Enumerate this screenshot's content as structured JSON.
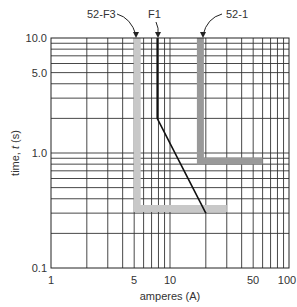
{
  "chart_data": {
    "type": "line",
    "title": "",
    "xlabel": "amperes (A)",
    "ylabel": "time, t (s)",
    "xscale": "log",
    "yscale": "log",
    "xlim": [
      1,
      100
    ],
    "ylim": [
      0.1,
      10
    ],
    "grid": true,
    "x_ticks": [
      "1",
      "5",
      "10",
      "50",
      "100"
    ],
    "y_ticks": [
      "0.1",
      "1.0",
      "5.0",
      "10.0"
    ],
    "series": [
      {
        "name": "52-F3",
        "color": "#c8c8c8",
        "style": "thick",
        "points": [
          [
            5.3,
            10
          ],
          [
            5.3,
            0.33
          ],
          [
            30,
            0.33
          ]
        ]
      },
      {
        "name": "F1",
        "color": "#111111",
        "style": "thin",
        "points": [
          [
            7.8,
            10
          ],
          [
            7.8,
            2.0
          ],
          [
            20,
            0.3
          ]
        ]
      },
      {
        "name": "52-1",
        "color": "#999999",
        "style": "thick",
        "points": [
          [
            18,
            10
          ],
          [
            18,
            0.85
          ],
          [
            60,
            0.85
          ]
        ]
      }
    ],
    "annotations": [
      {
        "text": "52-F3",
        "target": "52-F3"
      },
      {
        "text": "F1",
        "target": "F1"
      },
      {
        "text": "52-1",
        "target": "52-1"
      }
    ]
  },
  "labels": {
    "xlabel": "amperes (A)",
    "ylabel_prefix": "time, ",
    "ylabel_var": "t",
    "ylabel_suffix": " (s)",
    "callout_f3": "52-F3",
    "callout_f1": "F1",
    "callout_521": "52-1",
    "x_ticks": [
      "1",
      "5",
      "10",
      "50",
      "100"
    ],
    "y_ticks": [
      "0.1",
      "1.0",
      "5.0",
      "10.0"
    ]
  }
}
